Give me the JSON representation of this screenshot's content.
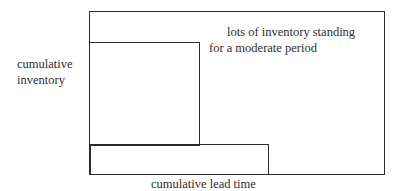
{
  "diagram": {
    "labels": {
      "y_axis_line1": "cumulative",
      "y_axis_line2": "inventory",
      "x_axis": "cumulative lead time",
      "annotation_line1": "lots of inventory standing",
      "annotation_line2": "for a moderate period"
    },
    "shapes": [
      {
        "name": "outer-frame",
        "type": "rectangle"
      },
      {
        "name": "tall-inventory-block",
        "type": "rectangle"
      },
      {
        "name": "wide-lead-time-block",
        "type": "rectangle"
      }
    ],
    "colors": {
      "stroke": "#2b2b2b",
      "text": "#2e2e2e",
      "background": "#ffffff"
    }
  }
}
